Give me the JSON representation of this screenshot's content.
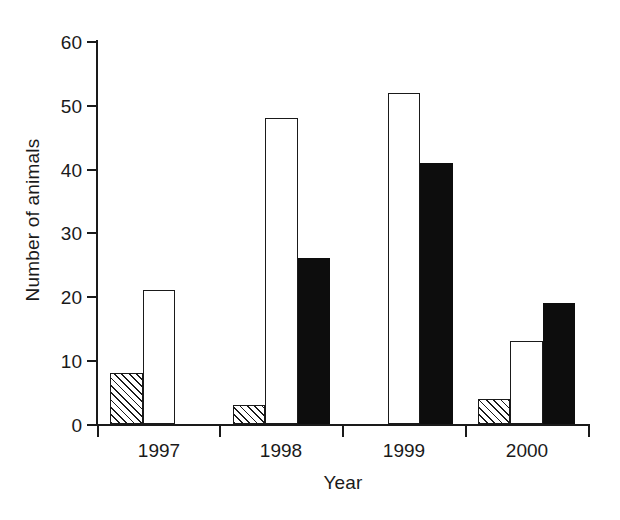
{
  "chart_data": {
    "type": "bar",
    "title": "",
    "xlabel": "Year",
    "ylabel": "Number of animals",
    "categories": [
      "1997",
      "1998",
      "1999",
      "2000"
    ],
    "ylim": [
      0,
      60
    ],
    "yticks": [
      0,
      10,
      20,
      30,
      40,
      50,
      60
    ],
    "ytick_labels": [
      "0",
      "10",
      "20",
      "30",
      "40",
      "50",
      "60"
    ],
    "grid": false,
    "legend": "none",
    "series": [
      {
        "name": "hatched",
        "fill": "diagonal-hatch",
        "color": "#1a1a1a",
        "values": [
          8,
          3,
          0,
          4
        ]
      },
      {
        "name": "white",
        "fill": "open",
        "color": "#ffffff",
        "values": [
          21,
          48,
          52,
          13
        ]
      },
      {
        "name": "black",
        "fill": "solid",
        "color": "#0d0d0d",
        "values": [
          0,
          26,
          41,
          19
        ]
      }
    ]
  },
  "axes": {
    "y_title": "Number of animals",
    "x_title": "Year",
    "y_ticks": [
      {
        "label": "60",
        "value": 60
      },
      {
        "label": "50",
        "value": 50
      },
      {
        "label": "40",
        "value": 40
      },
      {
        "label": "30",
        "value": 30
      },
      {
        "label": "20",
        "value": 20
      },
      {
        "label": "10",
        "value": 10
      },
      {
        "label": "0",
        "value": 0
      }
    ],
    "x_ticks": [
      {
        "label": "1997"
      },
      {
        "label": "1998"
      },
      {
        "label": "1999"
      },
      {
        "label": "2000"
      }
    ]
  },
  "colors": {
    "axis": "#1a1a1a",
    "bar_solid": "#0d0d0d",
    "bar_open": "#ffffff",
    "background": "#ffffff"
  }
}
